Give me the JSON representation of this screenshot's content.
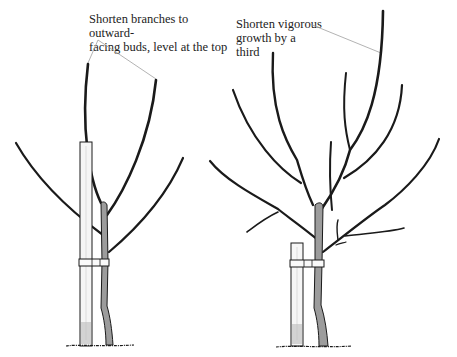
{
  "figure": {
    "type": "pruning-illustration",
    "panels": [
      {
        "id": "left-tree",
        "description": "young tree staked, two central leaders",
        "annotation": "Shorten branches to outward-\nfacing buds, level at the top"
      },
      {
        "id": "right-tree",
        "description": "older tree with more branches, staked",
        "annotation": "Shorten vigorous\ngrowth by a\nthird"
      }
    ]
  },
  "colors": {
    "line": "#1a1a1a",
    "leader_line": "#9a9a9a",
    "trunk_fill": "#9c9c9c",
    "stake_fill": "#f4f4f4",
    "background": "#ffffff"
  }
}
